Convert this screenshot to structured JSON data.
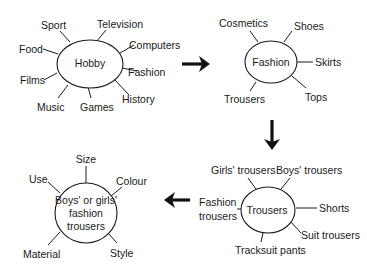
{
  "diagram": {
    "type": "mind-map-sequence",
    "maps": [
      {
        "id": "hobby",
        "center": "Hobby",
        "branches": [
          "Sport",
          "Television",
          "Food",
          "Computers",
          "Fashion",
          "Films",
          "History",
          "Music",
          "Games"
        ]
      },
      {
        "id": "fashion",
        "center": "Fashion",
        "branches": [
          "Cosmetics",
          "Shoes",
          "Skirts",
          "Trousers",
          "Tops"
        ]
      },
      {
        "id": "trousers",
        "center": "Trousers",
        "branches": [
          "Girls' trousers",
          "Boys' trousers",
          "Fashion trousers",
          "Shorts",
          "Suit trousers",
          "Tracksuit pants"
        ]
      },
      {
        "id": "boys-girls",
        "center_lines": [
          "Boys' or girls'",
          "fashion",
          "trousers"
        ],
        "branches": [
          "Size",
          "Use",
          "Colour",
          "Material",
          "Style"
        ]
      }
    ],
    "flow": [
      "Hobby",
      "Fashion",
      "Trousers",
      "Boys' or girls' fashion trousers"
    ],
    "arrows": [
      {
        "from": "hobby",
        "to": "fashion",
        "direction": "right"
      },
      {
        "from": "fashion",
        "to": "trousers",
        "direction": "down"
      },
      {
        "from": "trousers",
        "to": "boys-girls",
        "direction": "left"
      }
    ]
  },
  "labels": {
    "hobby": {
      "center": "Hobby",
      "sport": "Sport",
      "television": "Television",
      "food": "Food",
      "computers": "Computers",
      "fashion": "Fashion",
      "films": "Films",
      "history": "History",
      "music": "Music",
      "games": "Games"
    },
    "fashion": {
      "center": "Fashion",
      "cosmetics": "Cosmetics",
      "shoes": "Shoes",
      "skirts": "Skirts",
      "trousers": "Trousers",
      "tops": "Tops"
    },
    "trousers": {
      "center": "Trousers",
      "girls": "Girls' trousers",
      "boys": "Boys' trousers",
      "fashion_line1": "Fashion",
      "fashion_line2": "trousers",
      "shorts": "Shorts",
      "suit": "Suit trousers",
      "tracksuit": "Tracksuit pants"
    },
    "boys_girls": {
      "center_line1": "Boys' or girls'",
      "center_line2": "fashion",
      "center_line3": "trousers",
      "size": "Size",
      "use": "Use",
      "colour": "Colour",
      "material": "Material",
      "style": "Style"
    }
  }
}
